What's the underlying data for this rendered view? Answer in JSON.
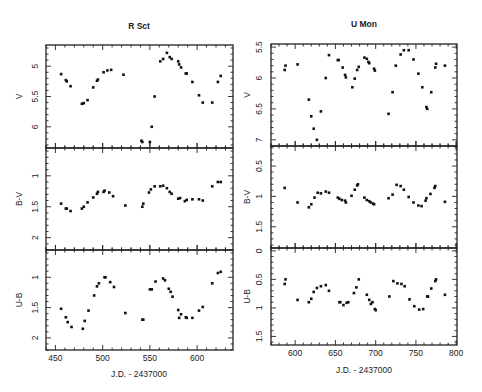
{
  "chart_data": [
    {
      "type": "scatter",
      "title": "R Sct",
      "xlabel": "J.D. - 2437000",
      "xlim": [
        440,
        638
      ],
      "xticks": [
        450,
        500,
        550,
        600
      ],
      "panels": [
        {
          "ylabel": "V",
          "ylim": [
            6.35,
            4.65
          ],
          "yticks": [
            5,
            5.5,
            6
          ],
          "tick_labels": [
            "5",
            "5.5",
            "6"
          ],
          "points": [
            [
              456,
              5.13
            ],
            [
              461,
              5.23
            ],
            [
              462,
              5.25
            ],
            [
              466,
              5.33
            ],
            [
              478,
              5.62
            ],
            [
              480,
              5.61
            ],
            [
              484,
              5.56
            ],
            [
              490,
              5.35
            ],
            [
              494,
              5.24
            ],
            [
              495,
              5.22
            ],
            [
              501,
              5.1
            ],
            [
              505,
              5.07
            ],
            [
              509,
              5.06
            ],
            [
              522,
              5.14
            ],
            [
              541,
              6.23
            ],
            [
              542,
              6.25
            ],
            [
              550,
              6.25
            ],
            [
              552,
              6.0
            ],
            [
              555,
              5.5
            ],
            [
              561,
              4.92
            ],
            [
              564,
              4.88
            ],
            [
              568,
              4.78
            ],
            [
              571,
              4.85
            ],
            [
              573,
              4.88
            ],
            [
              580,
              4.92
            ],
            [
              581,
              4.97
            ],
            [
              583,
              5.02
            ],
            [
              588,
              5.12
            ],
            [
              589,
              5.12
            ],
            [
              595,
              5.26
            ],
            [
              602,
              5.48
            ],
            [
              606,
              5.6
            ],
            [
              616,
              5.6
            ],
            [
              622,
              5.26
            ],
            [
              625,
              5.16
            ]
          ]
        },
        {
          "ylabel": "B-V",
          "ylim": [
            2.2,
            0.55
          ],
          "yticks": [
            1,
            1.5,
            2
          ],
          "tick_labels": [
            "1",
            "1.5",
            "2"
          ],
          "points": [
            [
              456,
              1.45
            ],
            [
              461,
              1.53
            ],
            [
              462,
              1.53
            ],
            [
              466,
              1.57
            ],
            [
              478,
              1.53
            ],
            [
              480,
              1.5
            ],
            [
              484,
              1.43
            ],
            [
              490,
              1.35
            ],
            [
              494,
              1.29
            ],
            [
              495,
              1.26
            ],
            [
              501,
              1.26
            ],
            [
              502,
              1.24
            ],
            [
              507,
              1.27
            ],
            [
              511,
              1.33
            ],
            [
              524,
              1.48
            ],
            [
              542,
              1.5
            ],
            [
              543,
              1.45
            ],
            [
              549,
              1.27
            ],
            [
              551,
              1.22
            ],
            [
              555,
              1.17
            ],
            [
              561,
              1.17
            ],
            [
              564,
              1.16
            ],
            [
              568,
              1.2
            ],
            [
              571,
              1.26
            ],
            [
              573,
              1.29
            ],
            [
              580,
              1.37
            ],
            [
              582,
              1.36
            ],
            [
              587,
              1.41
            ],
            [
              589,
              1.39
            ],
            [
              595,
              1.38
            ],
            [
              602,
              1.38
            ],
            [
              606,
              1.4
            ],
            [
              616,
              1.17
            ],
            [
              622,
              1.1
            ],
            [
              625,
              1.1
            ]
          ]
        },
        {
          "ylabel": "U-B",
          "ylim": [
            2.2,
            0.55
          ],
          "yticks": [
            1,
            1.5,
            2
          ],
          "tick_labels": [
            "1",
            "1.5",
            "2"
          ],
          "points": [
            [
              456,
              1.52
            ],
            [
              461,
              1.66
            ],
            [
              463,
              1.74
            ],
            [
              467,
              1.82
            ],
            [
              479,
              1.85
            ],
            [
              481,
              1.72
            ],
            [
              485,
              1.55
            ],
            [
              491,
              1.3
            ],
            [
              494,
              1.15
            ],
            [
              496,
              1.1
            ],
            [
              502,
              1.0
            ],
            [
              503,
              1.0
            ],
            [
              508,
              1.08
            ],
            [
              512,
              1.16
            ],
            [
              524,
              1.59
            ],
            [
              542,
              1.7
            ],
            [
              543,
              1.7
            ],
            [
              550,
              1.2
            ],
            [
              552,
              1.2
            ],
            [
              556,
              1.07
            ],
            [
              564,
              1.02
            ],
            [
              566,
              1.05
            ],
            [
              570,
              1.19
            ],
            [
              572,
              1.24
            ],
            [
              574,
              1.32
            ],
            [
              580,
              1.54
            ],
            [
              581,
              1.67
            ],
            [
              583,
              1.61
            ],
            [
              588,
              1.66
            ],
            [
              589,
              1.67
            ],
            [
              595,
              1.67
            ],
            [
              602,
              1.55
            ],
            [
              606,
              1.49
            ],
            [
              616,
              1.1
            ],
            [
              622,
              0.93
            ],
            [
              625,
              0.91
            ]
          ]
        }
      ]
    },
    {
      "type": "scatter",
      "title": "U Mon",
      "xlabel": "J.D. - 2437000",
      "xlim": [
        570,
        801
      ],
      "xticks": [
        600,
        650,
        700,
        750,
        800
      ],
      "panels": [
        {
          "ylabel": "V",
          "ylim": [
            7.1,
            5.45
          ],
          "yticks": [
            5.5,
            6,
            6.5,
            7
          ],
          "tick_labels": [
            "5.5",
            "6",
            "6.5",
            "7"
          ],
          "points": [
            [
              587,
              5.87
            ],
            [
              588,
              5.8
            ],
            [
              603,
              5.78
            ],
            [
              617,
              6.35
            ],
            [
              620,
              6.62
            ],
            [
              623,
              6.82
            ],
            [
              627,
              7.0
            ],
            [
              632,
              6.54
            ],
            [
              638,
              6.0
            ],
            [
              642,
              5.63
            ],
            [
              653,
              5.71
            ],
            [
              654,
              5.71
            ],
            [
              659,
              5.83
            ],
            [
              662,
              5.95
            ],
            [
              663,
              5.99
            ],
            [
              671,
              6.15
            ],
            [
              674,
              6.01
            ],
            [
              677,
              5.87
            ],
            [
              679,
              5.82
            ],
            [
              686,
              5.67
            ],
            [
              689,
              5.69
            ],
            [
              691,
              5.74
            ],
            [
              692,
              5.76
            ],
            [
              698,
              5.85
            ],
            [
              699,
              5.88
            ],
            [
              716,
              6.58
            ],
            [
              721,
              6.23
            ],
            [
              725,
              5.8
            ],
            [
              731,
              5.62
            ],
            [
              735,
              5.55
            ],
            [
              741,
              5.55
            ],
            [
              747,
              5.7
            ],
            [
              753,
              5.93
            ],
            [
              758,
              6.15
            ],
            [
              763,
              6.47
            ],
            [
              764,
              6.5
            ],
            [
              769,
              6.23
            ],
            [
              774,
              5.83
            ],
            [
              775,
              5.77
            ],
            [
              786,
              5.8
            ]
          ]
        },
        {
          "ylabel": "B-V",
          "ylim": [
            1.85,
            0.17
          ],
          "yticks": [
            0.5,
            1,
            1.5
          ],
          "tick_labels": [
            "0.5",
            "1",
            "1.5"
          ],
          "points": [
            [
              587,
              0.86
            ],
            [
              603,
              1.1
            ],
            [
              617,
              1.18
            ],
            [
              620,
              1.13
            ],
            [
              624,
              1.02
            ],
            [
              628,
              0.94
            ],
            [
              632,
              0.95
            ],
            [
              638,
              0.92
            ],
            [
              642,
              0.94
            ],
            [
              653,
              1.02
            ],
            [
              655,
              1.04
            ],
            [
              658,
              1.06
            ],
            [
              662,
              1.07
            ],
            [
              663,
              1.1
            ],
            [
              670,
              0.99
            ],
            [
              674,
              0.89
            ],
            [
              677,
              0.82
            ],
            [
              678,
              0.8
            ],
            [
              686,
              1.02
            ],
            [
              689,
              1.06
            ],
            [
              692,
              1.08
            ],
            [
              694,
              1.1
            ],
            [
              697,
              1.12
            ],
            [
              698,
              1.13
            ],
            [
              716,
              1.03
            ],
            [
              721,
              0.97
            ],
            [
              726,
              0.81
            ],
            [
              731,
              0.83
            ],
            [
              735,
              0.89
            ],
            [
              741,
              1.01
            ],
            [
              747,
              1.1
            ],
            [
              753,
              1.15
            ],
            [
              757,
              1.16
            ],
            [
              762,
              1.07
            ],
            [
              763,
              1.03
            ],
            [
              768,
              0.96
            ],
            [
              773,
              0.86
            ],
            [
              774,
              0.83
            ],
            [
              786,
              1.09
            ]
          ]
        },
        {
          "ylabel": "U-B",
          "ylim": [
            1.65,
            -0.05
          ],
          "yticks": [
            0,
            0.5,
            1,
            1.5
          ],
          "tick_labels": [
            "0",
            "0.5",
            "1",
            "1.5"
          ],
          "points": [
            [
              587,
              0.58
            ],
            [
              588,
              0.5
            ],
            [
              603,
              0.86
            ],
            [
              617,
              0.9
            ],
            [
              620,
              0.84
            ],
            [
              623,
              0.72
            ],
            [
              627,
              0.65
            ],
            [
              632,
              0.62
            ],
            [
              638,
              0.6
            ],
            [
              642,
              0.7
            ],
            [
              655,
              0.9
            ],
            [
              656,
              0.9
            ],
            [
              660,
              0.95
            ],
            [
              664,
              0.91
            ],
            [
              666,
              0.9
            ],
            [
              673,
              0.74
            ],
            [
              676,
              0.64
            ],
            [
              679,
              0.5
            ],
            [
              689,
              0.77
            ],
            [
              692,
              0.86
            ],
            [
              694,
              0.93
            ],
            [
              696,
              0.9
            ],
            [
              699,
              1.02
            ],
            [
              700,
              1.04
            ],
            [
              717,
              0.8
            ],
            [
              722,
              0.53
            ],
            [
              727,
              0.57
            ],
            [
              732,
              0.58
            ],
            [
              736,
              0.62
            ],
            [
              742,
              0.85
            ],
            [
              748,
              0.97
            ],
            [
              754,
              1.03
            ],
            [
              759,
              1.02
            ],
            [
              764,
              0.8
            ],
            [
              765,
              0.8
            ],
            [
              769,
              0.66
            ],
            [
              774,
              0.53
            ],
            [
              775,
              0.5
            ],
            [
              786,
              0.77
            ]
          ]
        }
      ]
    }
  ]
}
